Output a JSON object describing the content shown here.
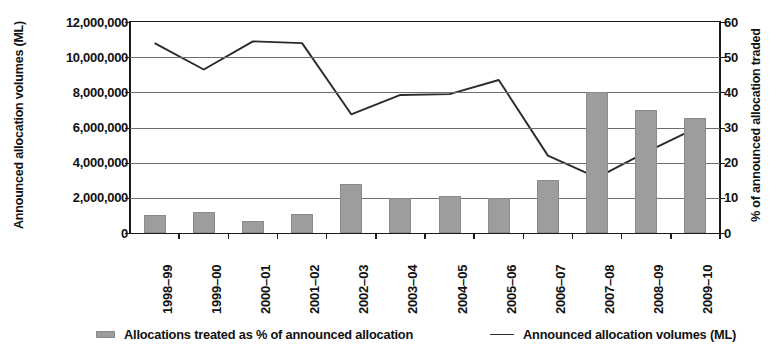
{
  "chart_data": {
    "type": "bar",
    "title": "",
    "subtitle": "",
    "categories": [
      "1998–99",
      "1999–00",
      "2000–01",
      "2001–02",
      "2002–03",
      "2003–04",
      "2004–05",
      "2005–06",
      "2006–07",
      "2007–08",
      "2008–09",
      "2009–10"
    ],
    "xlabel": "",
    "ylabel": "Announced allocation volumes (ML)",
    "y2label": "% of announced allocation traded",
    "ylim": [
      0,
      12000000
    ],
    "y2lim": [
      0,
      60
    ],
    "yticks": [
      "0",
      "2,000,000",
      "4,000,000",
      "6,000,000",
      "8,000,000",
      "10,000,000",
      "12,000,000"
    ],
    "ytick_values": [
      0,
      2000000,
      4000000,
      6000000,
      8000000,
      10000000,
      12000000
    ],
    "y2ticks": [
      "0",
      "10",
      "20",
      "30",
      "40",
      "50",
      "60"
    ],
    "y2tick_values": [
      0,
      10,
      20,
      30,
      40,
      50,
      60
    ],
    "grid": true,
    "legend_position": "bottom",
    "series": [
      {
        "name": "Allocations treated as % of announced allocation",
        "type": "bar",
        "axis": "right",
        "unit": "%",
        "color": "#9d9d9d",
        "values": [
          5.0,
          6.0,
          3.5,
          5.5,
          14.0,
          10.0,
          10.5,
          10.0,
          15.0,
          40.2,
          35.0,
          32.7
        ]
      },
      {
        "name": "Announced allocation volumes (ML)",
        "type": "line",
        "axis": "left",
        "unit": "ML",
        "color": "#2b2b2b",
        "values": [
          10800000,
          9300000,
          10900000,
          10800000,
          6750000,
          7850000,
          7900000,
          8700000,
          4400000,
          3150000,
          4600000,
          5950000
        ]
      }
    ]
  },
  "legend": {
    "bar_label": "Allocations treated as % of announced allocation",
    "line_label": "Announced allocation volumes (ML)"
  }
}
